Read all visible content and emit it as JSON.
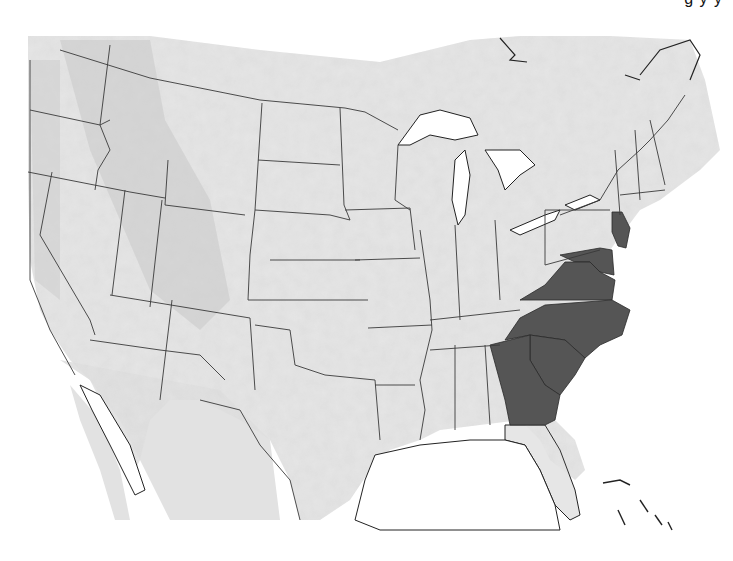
{
  "title_fragment": "g  y  y",
  "map": {
    "type": "shaded-relief",
    "region": "Contiguous United States with parts of Canada, Mexico and the Bahamas",
    "colors": {
      "background": "#ffffff",
      "land": "#e4e4e4",
      "land_relief_dark": "#bdbdbd",
      "water": "#ffffff",
      "border": "#3a3a3a",
      "highlight": "#555555"
    },
    "highlighted_states": [
      "New Jersey",
      "Delaware",
      "Maryland",
      "Virginia",
      "North Carolina",
      "South Carolina",
      "Georgia"
    ]
  }
}
